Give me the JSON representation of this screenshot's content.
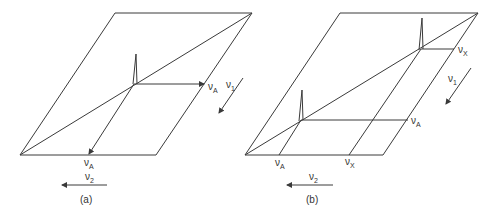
{
  "figure": {
    "panels": [
      {
        "id": "a",
        "caption": "(a)",
        "description": "2D spectrum of a single-spin A system: one diagonal peak at (νA, νA)",
        "axis_labels": {
          "nu1": {
            "symbol": "ν",
            "sub": "1"
          },
          "nu2": {
            "symbol": "ν",
            "sub": "2"
          }
        },
        "peak_labels": {
          "right": {
            "symbol": "ν",
            "sub": "A"
          },
          "bottom": {
            "symbol": "ν",
            "sub": "A"
          }
        }
      },
      {
        "id": "b",
        "caption": "(b)",
        "description": "2D spectrum of uncoupled A and X spins: two diagonal peaks at (νA, νA) and (νX, νX)",
        "axis_labels": {
          "nu1": {
            "symbol": "ν",
            "sub": "1"
          },
          "nu2": {
            "symbol": "ν",
            "sub": "2"
          }
        },
        "peak_labels": {
          "right_x": {
            "symbol": "ν",
            "sub": "X"
          },
          "right_a": {
            "symbol": "ν",
            "sub": "A"
          },
          "bottom_a": {
            "symbol": "ν",
            "sub": "A"
          },
          "bottom_x": {
            "symbol": "ν",
            "sub": "X"
          }
        }
      }
    ],
    "colors": {
      "line": "#3a3a3a",
      "text": "#333333",
      "background": "#ffffff"
    }
  }
}
